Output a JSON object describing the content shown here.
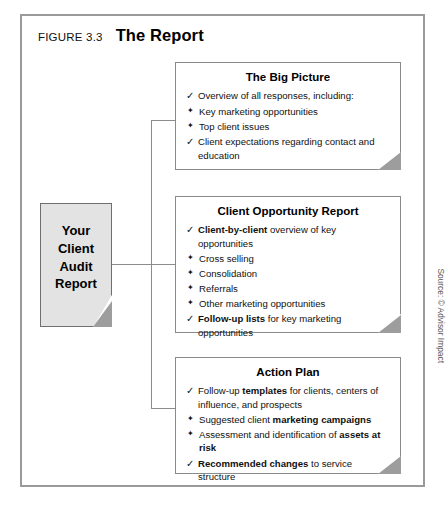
{
  "figure": {
    "label": "FIGURE 3.3",
    "title": "The Report",
    "source": "Source: © Advisor Impact"
  },
  "client_box": {
    "lines": [
      "Your",
      "Client",
      "Audit",
      "Report"
    ]
  },
  "boxes": [
    {
      "title": "The Big Picture",
      "items": [
        {
          "glyph": "check",
          "parts": [
            {
              "text": "Overview of all responses, including:",
              "bold": false
            }
          ]
        },
        {
          "glyph": "diamond",
          "parts": [
            {
              "text": "Key marketing opportunities",
              "bold": false
            }
          ]
        },
        {
          "glyph": "diamond",
          "parts": [
            {
              "text": "Top client issues",
              "bold": false
            }
          ]
        },
        {
          "glyph": "check",
          "parts": [
            {
              "text": "Client expectations regarding contact and education",
              "bold": false
            }
          ]
        }
      ]
    },
    {
      "title": "Client Opportunity Report",
      "items": [
        {
          "glyph": "check",
          "parts": [
            {
              "text": "Client-by-client",
              "bold": true
            },
            {
              "text": " overview of key opportunities",
              "bold": false
            }
          ]
        },
        {
          "glyph": "diamond",
          "parts": [
            {
              "text": "Cross selling",
              "bold": false
            }
          ]
        },
        {
          "glyph": "diamond",
          "parts": [
            {
              "text": "Consolidation",
              "bold": false
            }
          ]
        },
        {
          "glyph": "diamond",
          "parts": [
            {
              "text": "Referrals",
              "bold": false
            }
          ]
        },
        {
          "glyph": "diamond",
          "parts": [
            {
              "text": "Other marketing opportunities",
              "bold": false
            }
          ]
        },
        {
          "glyph": "check",
          "parts": [
            {
              "text": "Follow-up lists",
              "bold": true
            },
            {
              "text": " for key marketing opportunities",
              "bold": false
            }
          ]
        }
      ]
    },
    {
      "title": "Action Plan",
      "items": [
        {
          "glyph": "check",
          "parts": [
            {
              "text": "Follow-up ",
              "bold": false
            },
            {
              "text": "templates",
              "bold": true
            },
            {
              "text": " for clients, centers of influence, and prospects",
              "bold": false
            }
          ]
        },
        {
          "glyph": "diamond",
          "parts": [
            {
              "text": "Suggested client ",
              "bold": false
            },
            {
              "text": "marketing campaigns",
              "bold": true
            }
          ]
        },
        {
          "glyph": "diamond",
          "parts": [
            {
              "text": "Assessment and identification of ",
              "bold": false
            },
            {
              "text": "assets at risk",
              "bold": true
            }
          ]
        },
        {
          "glyph": "check",
          "parts": [
            {
              "text": "Recommended changes",
              "bold": true
            },
            {
              "text": " to service structure",
              "bold": false
            }
          ]
        }
      ]
    }
  ],
  "glyphs": {
    "check": "✓",
    "diamond": "✦"
  }
}
